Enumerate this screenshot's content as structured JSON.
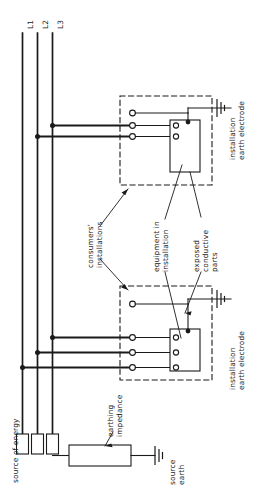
{
  "diagram": {
    "line_labels": [
      "L1",
      "L2",
      "L3"
    ],
    "labels": {
      "source_of_energy": "source of energy",
      "earthing_impedance": "earthing\nimpedance",
      "source_earth": "source\nearth",
      "consumers_installations": "consumers'\ninstallations",
      "equipment_in_installation": "equipment in\ninstallation",
      "exposed_conductive_parts": "exposed\nconductive\nparts",
      "installation_earth_electrode_upper": "installation\nearth electrode",
      "installation_earth_electrode_lower": "installation\nearth electrode"
    },
    "colors": {
      "line": "#1a1a1a",
      "text": "#1a1a1a",
      "background": "#ffffff",
      "bus": "#111111"
    },
    "installations": [
      {
        "id": "upper-installation",
        "phase_count": 2,
        "connected_lines": [
          "L3",
          "L2"
        ],
        "has_earth_electrode": true
      },
      {
        "id": "lower-installation",
        "phase_count": 3,
        "connected_lines": [
          "L3",
          "L2",
          "L1"
        ],
        "has_earth_electrode": true
      }
    ],
    "symbols": {
      "earth_electrode": "earth-symbol",
      "junction_dot": "junction-dot",
      "terminal": "terminal-circle",
      "impedance_block": "rectangle"
    }
  }
}
